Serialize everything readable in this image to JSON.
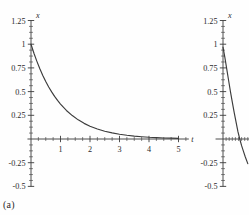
{
  "figure": {
    "background": "#fefefe",
    "axis_color": "#3a3a3a",
    "curve_color": "#3c3c3c"
  },
  "panels": [
    {
      "id": "a",
      "caption": "(a)",
      "xlabel": "t",
      "ylabel": "x"
    },
    {
      "id": "b",
      "caption": "(b)",
      "xlabel": "t",
      "ylabel": "x"
    }
  ],
  "chart_data": [
    {
      "type": "line",
      "title": "(a)",
      "xlabel": "t",
      "ylabel": "x",
      "xlim": [
        -0.12,
        5.35
      ],
      "ylim": [
        -0.5,
        1.25
      ],
      "grid": false,
      "legend": "none",
      "xticks": [
        1,
        2,
        3,
        4,
        5
      ],
      "xtick_labels": [
        "1",
        "2",
        "3",
        "4",
        "5"
      ],
      "yticks": [
        -0.5,
        -0.25,
        0.25,
        0.5,
        0.75,
        1,
        1.25
      ],
      "ytick_labels": [
        "-0.5",
        "-0.25",
        "0.25",
        "0.5",
        "0.75",
        "1",
        "1.25"
      ],
      "x_minor_step": 0.25,
      "y_minor_step": 0.0625,
      "annotation": "exponential decay from x=1 at t=0 approaching 0",
      "series": [
        {
          "name": "x(t)",
          "x": [
            0,
            0.1,
            0.2,
            0.3,
            0.4,
            0.5,
            0.6,
            0.7,
            0.8,
            0.9,
            1,
            1.2,
            1.4,
            1.6,
            1.8,
            2,
            2.25,
            2.5,
            2.75,
            3,
            3.25,
            3.5,
            3.75,
            4,
            4.25,
            4.5,
            4.75,
            5
          ],
          "y": [
            1,
            0.905,
            0.819,
            0.741,
            0.67,
            0.607,
            0.549,
            0.497,
            0.449,
            0.407,
            0.368,
            0.301,
            0.247,
            0.202,
            0.165,
            0.135,
            0.105,
            0.082,
            0.064,
            0.05,
            0.039,
            0.03,
            0.024,
            0.018,
            0.014,
            0.011,
            0.009,
            0.007
          ]
        }
      ]
    },
    {
      "type": "line",
      "title": "(b)",
      "xlabel": "t",
      "ylabel": "x",
      "xlim": [
        -0.12,
        0.55
      ],
      "ylim": [
        -0.5,
        1.25
      ],
      "grid": false,
      "legend": "none",
      "xticks": [],
      "xtick_labels": [],
      "yticks": [
        -0.5,
        -0.25,
        0.25,
        0.5,
        0.75,
        1,
        1.25
      ],
      "ytick_labels": [
        "-0.5",
        "-0.25",
        "0.25",
        "0.5",
        "0.75",
        "1",
        "1.25"
      ],
      "x_minor_step": 0.05,
      "y_minor_step": 0.0625,
      "annotation": "steeply decreasing curve crossing zero near t=0.27, clipped at panel edge",
      "series": [
        {
          "name": "x(t)",
          "x": [
            0,
            0.03,
            0.06,
            0.09,
            0.12,
            0.15,
            0.18,
            0.21,
            0.24,
            0.27,
            0.3,
            0.33,
            0.36,
            0.4
          ],
          "y": [
            0.97,
            0.86,
            0.74,
            0.62,
            0.5,
            0.39,
            0.28,
            0.18,
            0.08,
            0.0,
            -0.07,
            -0.13,
            -0.19,
            -0.26
          ]
        }
      ]
    }
  ]
}
